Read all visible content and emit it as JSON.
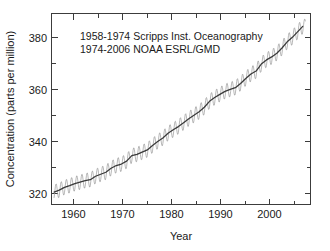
{
  "figure": {
    "name": "atmospheric-co2-concentration-chart",
    "background_color": "#ffffff",
    "frame_color": "#3c3c3c"
  },
  "annotations": {
    "line1": "1958-1974 Scripps Inst. Oceanography",
    "line2": "1974-2006 NOAA ESRL/GMD"
  },
  "axes": {
    "x_title": "Year",
    "y_title": "Concentration (parts per million)",
    "x_ticks": [
      "1960",
      "1970",
      "1980",
      "1990",
      "2000"
    ],
    "y_ticks": [
      "320",
      "340",
      "360",
      "380"
    ]
  },
  "chart_data": {
    "type": "line",
    "title": "",
    "subtitle": "",
    "xlabel": "Year",
    "ylabel": "Concentration (parts per million)",
    "xlim": [
      1957.5,
      2007.5
    ],
    "ylim": [
      310,
      387
    ],
    "xticks": [
      1960,
      1970,
      1980,
      1990,
      2000
    ],
    "yticks": [
      320,
      340,
      360,
      380
    ],
    "xminorticks": [
      1965,
      1975,
      1985,
      1995,
      2005
    ],
    "yminorticks": [
      330,
      350,
      370
    ],
    "grid": false,
    "legend": "none",
    "annotations": [
      "1958-1974 Scripps Inst. Oceanography",
      "1974-2006 NOAA ESRL/GMD"
    ],
    "seasonal_amplitude_ppm": 3.0,
    "series": [
      {
        "name": "Monthly mean CO2 (with seasonal cycle)",
        "color": "#9a9a9a",
        "note": "sawtooth seasonal oscillation about the annual trend, peak in May, trough in September"
      },
      {
        "name": "Annual mean CO2 trend",
        "color": "#3a3a3a",
        "x": [
          1958,
          1959,
          1960,
          1961,
          1962,
          1963,
          1964,
          1965,
          1966,
          1967,
          1968,
          1969,
          1970,
          1971,
          1972,
          1973,
          1974,
          1975,
          1976,
          1977,
          1978,
          1979,
          1980,
          1981,
          1982,
          1983,
          1984,
          1985,
          1986,
          1987,
          1988,
          1989,
          1990,
          1991,
          1992,
          1993,
          1994,
          1995,
          1996,
          1997,
          1998,
          1999,
          2000,
          2001,
          2002,
          2003,
          2004,
          2005,
          2006
        ],
        "values": [
          315.0,
          315.8,
          316.9,
          317.6,
          318.4,
          319.0,
          319.6,
          320.0,
          321.4,
          322.2,
          323.0,
          324.6,
          325.7,
          326.3,
          327.5,
          329.7,
          330.2,
          331.1,
          332.0,
          333.8,
          335.4,
          336.8,
          338.7,
          340.1,
          341.4,
          343.0,
          344.6,
          346.0,
          347.4,
          349.2,
          351.6,
          353.1,
          354.4,
          355.6,
          356.4,
          357.1,
          358.8,
          360.8,
          362.6,
          363.8,
          366.6,
          368.3,
          369.5,
          371.0,
          373.1,
          375.6,
          377.4,
          379.6,
          381.8
        ]
      }
    ]
  }
}
